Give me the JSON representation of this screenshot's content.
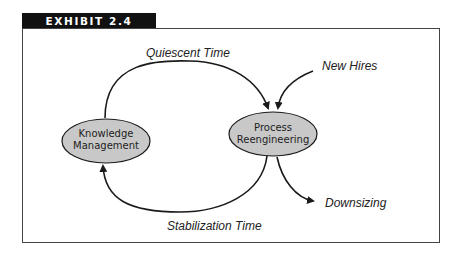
{
  "exhibit": {
    "label": "EXHIBIT 2.4"
  },
  "nodes": [
    {
      "id": "knowledge",
      "lines": [
        "Knowledge",
        "Management"
      ]
    },
    {
      "id": "process",
      "lines": [
        "Process",
        "Reengineering"
      ]
    }
  ],
  "edges": {
    "quiescent": "Quiescent Time",
    "stabilization": "Stabilization Time",
    "new_hires": "New Hires",
    "downsizing": "Downsizing"
  },
  "colors": {
    "node_fill": "#c8c8c8",
    "stroke": "#1a1a1a",
    "tab_bg": "#111111"
  }
}
